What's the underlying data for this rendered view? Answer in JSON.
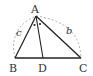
{
  "diagram": {
    "vertices": {
      "A": {
        "label": "A",
        "x": 36,
        "y": 16
      },
      "B": {
        "label": "B",
        "x": 15,
        "y": 58
      },
      "C": {
        "label": "C",
        "x": 81,
        "y": 58
      },
      "D": {
        "label": "D",
        "x": 43,
        "y": 58
      }
    },
    "side_labels": {
      "c": {
        "label": "c",
        "side": "AB"
      },
      "b": {
        "label": "b",
        "side": "AC"
      }
    },
    "angle_marks": {
      "symbol": "•",
      "count": 2,
      "meaning": "angle BAD = angle DAC"
    },
    "colors": {
      "stroke": "#222222",
      "dashed": "#999999",
      "text": "#333333"
    }
  }
}
